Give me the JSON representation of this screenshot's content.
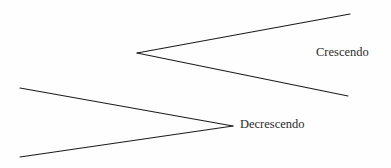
{
  "page": {
    "background_color": "#fefefe",
    "width": 391,
    "height": 168
  },
  "style": {
    "line_color": "#1c1c1c",
    "line_width": 1.15,
    "text_color": "#2a2a2a",
    "font_size": "12.5px"
  },
  "chart_data": {
    "type": "diagram",
    "shapes": [
      {
        "name": "crescendo-hairpin",
        "symbol": "<",
        "meaning": "gradually louder",
        "vertex": {
          "x": 137,
          "y": 53
        },
        "upper_arm_end": {
          "x": 350,
          "y": 14
        },
        "lower_arm_end": {
          "x": 348,
          "y": 96
        },
        "opening": "right"
      },
      {
        "name": "decrescendo-hairpin",
        "symbol": ">",
        "meaning": "gradually softer",
        "vertex": {
          "x": 233,
          "y": 126
        },
        "upper_arm_end": {
          "x": 20,
          "y": 88
        },
        "lower_arm_end": {
          "x": 20,
          "y": 157
        },
        "opening": "left"
      }
    ],
    "labels": [
      {
        "name": "crescendo-label",
        "text": "Crescendo",
        "x": 316,
        "y": 46
      },
      {
        "name": "decrescendo-label",
        "text": "Decrescendo",
        "x": 240,
        "y": 118
      }
    ]
  },
  "labels": {
    "crescendo": "Crescendo",
    "decrescendo": "Decrescendo"
  },
  "icons": {
    "crescendo": "crescendo-hairpin-icon",
    "decrescendo": "decrescendo-hairpin-icon"
  }
}
